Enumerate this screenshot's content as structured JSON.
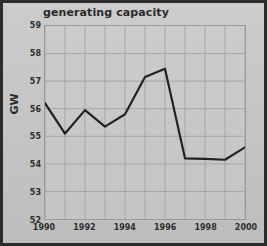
{
  "chart_data": {
    "type": "line",
    "title": "generating capacity",
    "xlabel": "",
    "ylabel": "GW",
    "x": [
      1990,
      1991,
      1992,
      1993,
      1994,
      1995,
      1996,
      1997,
      1998,
      1999,
      2000
    ],
    "values": [
      56.2,
      55.1,
      55.95,
      55.35,
      55.8,
      57.15,
      57.45,
      54.2,
      54.18,
      54.15,
      54.6
    ],
    "series": [
      {
        "name": "generating capacity",
        "values": [
          56.2,
          55.1,
          55.95,
          55.35,
          55.8,
          57.15,
          57.45,
          54.2,
          54.18,
          54.15,
          54.6
        ]
      }
    ],
    "xlim": [
      1990,
      2000
    ],
    "ylim": [
      52,
      59
    ],
    "ytick_labels": [
      "52",
      "53",
      "54",
      "55",
      "56",
      "57",
      "58",
      "59"
    ],
    "ytick_values": [
      52,
      53,
      54,
      55,
      56,
      57,
      58,
      59
    ],
    "xtick_labels": [
      "1990",
      "1992",
      "1994",
      "1996",
      "1998",
      "2000"
    ],
    "xtick_values": [
      1990,
      1992,
      1994,
      1996,
      1998,
      2000
    ],
    "grid": true,
    "grid_x_values": [
      1990,
      1991,
      1992,
      1993,
      1994,
      1995,
      1996,
      1997,
      1998,
      1999,
      2000
    ],
    "legend": null,
    "legend_position": "none",
    "annotations": [],
    "line_color": "#222222",
    "grid_color": "#9d9d9d",
    "background_color": "#c6c6c6",
    "frame_color": "#2b2b2b"
  }
}
